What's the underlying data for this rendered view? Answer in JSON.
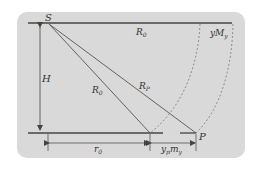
{
  "diagram": {
    "labels": {
      "S": "S",
      "P": "P",
      "H": "H",
      "R0_top": "R",
      "R0_top_sub": "0",
      "R0_line": "R",
      "R0_line_sub": "0",
      "RP_line": "R",
      "RP_line_sub": "P",
      "yMy": "yM",
      "yMy_sub": "y",
      "r0": "r",
      "r0_sub": "0",
      "ypmy_y": "y",
      "ypmy_ysub": "p",
      "ypmy_m": "m",
      "ypmy_msub": "y"
    },
    "colors": {
      "background": "#ffffff",
      "panel": "#d9d9d9",
      "line": "#444444",
      "dashed": "#777777",
      "text": "#333333"
    }
  }
}
